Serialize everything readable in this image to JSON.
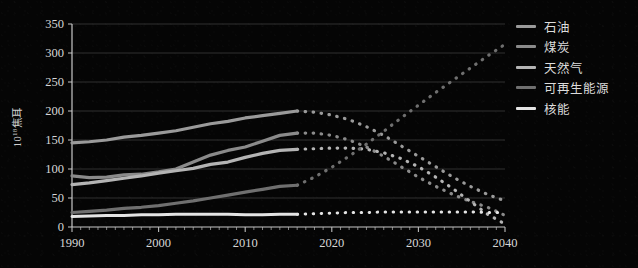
{
  "axis": {
    "y_label_prefix": "10",
    "y_label_exponent": "18",
    "y_label_unit": "焦耳",
    "y_ticks": [
      "0",
      "50",
      "100",
      "150",
      "200",
      "250",
      "300",
      "350"
    ],
    "x_ticks": [
      "1990",
      "2000",
      "2010",
      "2020",
      "2030",
      "2040"
    ]
  },
  "legend": {
    "items": [
      {
        "label": "石油",
        "color": "#9a9a9a"
      },
      {
        "label": "煤炭",
        "color": "#8a8a8a"
      },
      {
        "label": "天然气",
        "color": "#b4b4b4"
      },
      {
        "label": "可再生能源",
        "color": "#6f6f6f"
      },
      {
        "label": "核能",
        "color": "#e4e4e4"
      }
    ]
  },
  "chart_data": {
    "type": "line",
    "title": "",
    "xlabel": "",
    "ylabel": "10^18 焦耳",
    "xlim": [
      1990,
      2040
    ],
    "ylim": [
      0,
      350
    ],
    "grid": true,
    "legend_position": "right",
    "history_end_year": 2016,
    "note": "Solid segment = history (1990-2016); dotted segment = projection (2016-2040)",
    "x": [
      1990,
      1992,
      1994,
      1996,
      1998,
      2000,
      2002,
      2004,
      2006,
      2008,
      2010,
      2012,
      2014,
      2016,
      2018,
      2020,
      2022,
      2024,
      2026,
      2028,
      2030,
      2032,
      2034,
      2036,
      2038,
      2040
    ],
    "series": [
      {
        "name": "石油",
        "color": "#9a9a9a",
        "values": [
          145,
          147,
          150,
          155,
          158,
          162,
          166,
          172,
          178,
          182,
          188,
          192,
          196,
          200,
          198,
          193,
          185,
          173,
          158,
          140,
          122,
          104,
          86,
          70,
          56,
          45
        ]
      },
      {
        "name": "煤炭",
        "color": "#8a8a8a",
        "values": [
          88,
          85,
          86,
          90,
          91,
          95,
          100,
          112,
          124,
          132,
          138,
          148,
          158,
          162,
          162,
          158,
          150,
          138,
          122,
          104,
          86,
          70,
          56,
          44,
          34,
          20
        ]
      },
      {
        "name": "天然气",
        "color": "#b4b4b4",
        "values": [
          73,
          76,
          80,
          84,
          88,
          93,
          97,
          101,
          108,
          112,
          120,
          127,
          132,
          134,
          135,
          136,
          136,
          134,
          128,
          118,
          104,
          86,
          66,
          44,
          22,
          5
        ]
      },
      {
        "name": "可再生能源",
        "color": "#6f6f6f",
        "values": [
          25,
          27,
          29,
          32,
          34,
          37,
          41,
          45,
          50,
          55,
          60,
          65,
          70,
          72,
          86,
          103,
          122,
          143,
          165,
          188,
          210,
          232,
          253,
          274,
          295,
          315
        ]
      },
      {
        "name": "核能",
        "color": "#e4e4e4",
        "values": [
          18,
          19,
          20,
          20,
          21,
          21,
          22,
          22,
          22,
          22,
          21,
          21,
          22,
          22,
          23,
          24,
          25,
          25,
          26,
          26,
          26,
          26,
          26,
          26,
          25,
          25
        ]
      }
    ]
  }
}
